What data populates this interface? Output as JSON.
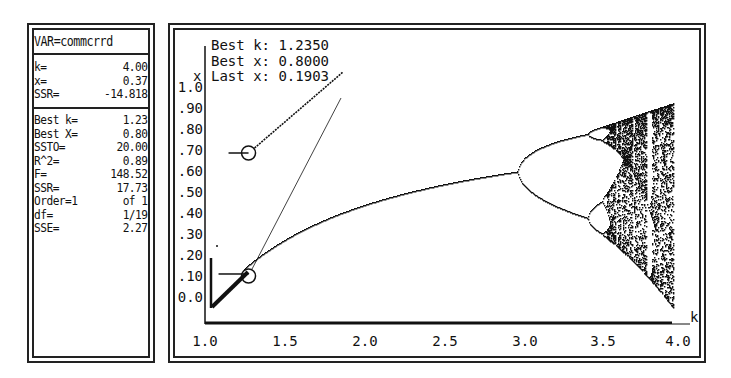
{
  "left_panel": {
    "variable_label": "VAR=commcrrd",
    "current": [
      {
        "label": "k=",
        "value": "4.00"
      },
      {
        "label": "x=",
        "value": "0.37"
      },
      {
        "label": "SSR=",
        "value": "-14.818"
      }
    ],
    "stats": [
      {
        "label": "Best k=",
        "value": "1.23"
      },
      {
        "label": "Best X=",
        "value": "0.80"
      },
      {
        "label": "SSTO=",
        "value": "20.00"
      },
      {
        "label": "R^2=",
        "value": "0.89"
      },
      {
        "label": "F=",
        "value": "148.52"
      },
      {
        "label": "SSR=",
        "value": "17.73"
      },
      {
        "label": "Order=1",
        "value": "of 1"
      },
      {
        "label": "df=",
        "value": "1/19"
      },
      {
        "label": "SSE=",
        "value": "2.27"
      }
    ]
  },
  "chart_panel": {
    "info_lines": [
      "Best k: 1.2350",
      "Best x: 0.8000",
      "Last x: 0.1903"
    ]
  },
  "chart_data": {
    "type": "scatter",
    "title": "",
    "xlabel": "k",
    "ylabel": "x",
    "xlim": [
      1.0,
      4.0
    ],
    "ylim": [
      0.0,
      1.0
    ],
    "x_ticks": [
      "1.0",
      "1.5",
      "2.0",
      "2.5",
      "3.0",
      "3.5",
      "4.0"
    ],
    "y_ticks": [
      "1.0",
      ".90",
      ".80",
      ".70",
      ".60",
      ".50",
      ".40",
      ".30",
      ".20",
      ".10",
      "0.0"
    ],
    "grid": false,
    "legend": null,
    "series": [
      {
        "name": "bifurcation",
        "k_start": 1.0,
        "k_end": 4.0,
        "fixed_point_formula": "1-1/k",
        "period_doubling_k": [
          3.0,
          3.449,
          3.544
        ],
        "chaos_onset_k": 3.57
      },
      {
        "name": "best-fit marker",
        "points": [
          {
            "k": 1.235,
            "x": 0.8
          }
        ]
      },
      {
        "name": "last-fit marker",
        "points": [
          {
            "k": 1.235,
            "x": 0.19
          }
        ]
      }
    ],
    "annotations": {
      "best_k": 1.235,
      "best_x": 0.8,
      "last_x": 0.1903
    }
  }
}
